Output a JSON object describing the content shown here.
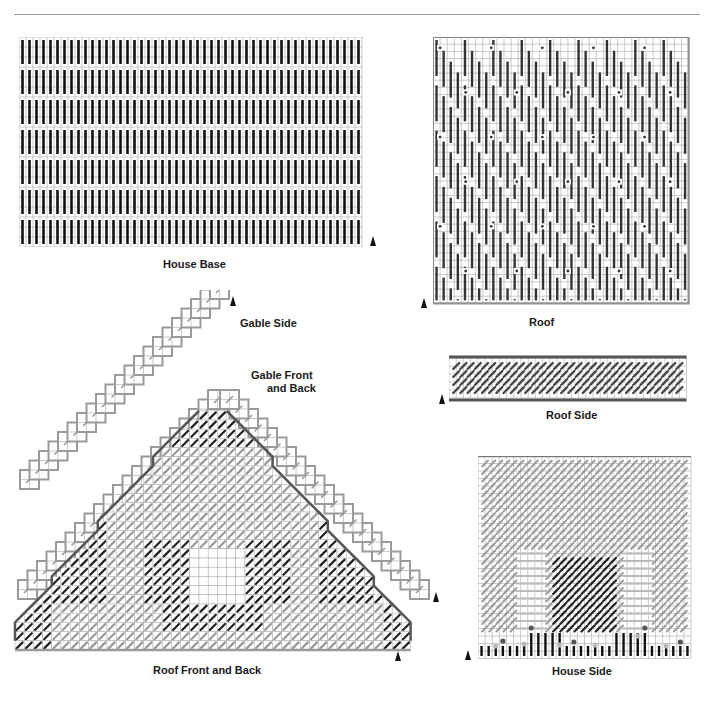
{
  "page": {
    "divider": true
  },
  "charts": {
    "house_base": {
      "title": "House Base",
      "cols": 49,
      "rows": 21,
      "stitch": "vertical-bar",
      "stitch_color": "#111111"
    },
    "roof": {
      "title": "Roof",
      "cols": 36,
      "rows": 37,
      "stitch": "vertical-bar-diamond",
      "stitch_color": "#333333"
    },
    "roof_side": {
      "title": "Roof Side",
      "cols": 33,
      "rows": 5,
      "stitch": "diagonal",
      "stitch_color": "#444444",
      "border_color": "#555555"
    },
    "gable_side": {
      "title": "Gable Side"
    },
    "gable_front_back": {
      "title_line1": "Gable Front",
      "title_line2": "and Back"
    },
    "roof_front_back": {
      "title": "Roof Front and Back"
    },
    "house_side": {
      "title": "House Side",
      "cols": 30,
      "rows": 27
    }
  },
  "colors": {
    "grid": "#a8a8a8",
    "dark_stitch": "#222222",
    "light_stitch": "#999999",
    "outline_dark": "#555555",
    "outline_light": "#9a9a9a"
  }
}
